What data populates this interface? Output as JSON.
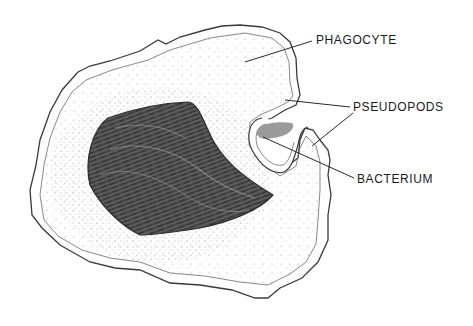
{
  "diagram": {
    "labels": {
      "phagocyte": "PHAGOCYTE",
      "pseudopods": "PSEUDOPODS",
      "bacterium": "BACTERIUM"
    },
    "colors": {
      "outline": "#3a3a3a",
      "nucleus": "#3d3d3d",
      "nucleus_highlight": "#8a8a8a",
      "bacterium": "#9a9a9a",
      "stipple": "#555555",
      "label_text": "#1a1a1a"
    }
  }
}
